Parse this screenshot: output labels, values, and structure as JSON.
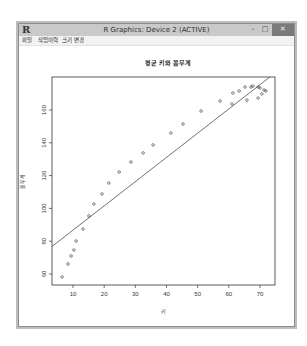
{
  "window": {
    "title": "R Graphics: Device 2 (ACTIVE)",
    "logo": "R",
    "controls": {
      "minimize": "–",
      "maximize": "□",
      "close": "✕"
    }
  },
  "menu": {
    "items": [
      {
        "label": "파일"
      },
      {
        "label": "작업이력"
      },
      {
        "label": "크기 변경"
      }
    ]
  },
  "colors": {
    "titlebar": "#c9c9c9",
    "close_button": "#7a7a7a",
    "plot_ink": "#333333"
  },
  "chart_data": {
    "type": "scatter",
    "title": "평균 키와 몸무게",
    "xlabel": "키",
    "ylabel": "몸무게",
    "xlim": [
      3.5,
      74.5
    ],
    "ylim": [
      54,
      182
    ],
    "xticks": [
      10,
      20,
      30,
      40,
      50,
      60,
      70
    ],
    "yticks": [
      60,
      80,
      100,
      120,
      140,
      160
    ],
    "grid": false,
    "marker": "open-circle",
    "points": [
      [
        6.5,
        58.2
      ],
      [
        8.4,
        66.1
      ],
      [
        9.4,
        71.0
      ],
      [
        10.3,
        74.6
      ],
      [
        11.0,
        80.1
      ],
      [
        13.2,
        87.4
      ],
      [
        15.1,
        95.4
      ],
      [
        16.7,
        102.7
      ],
      [
        19.3,
        108.8
      ],
      [
        21.5,
        115.5
      ],
      [
        24.8,
        122.2
      ],
      [
        28.6,
        128.3
      ],
      [
        32.5,
        133.8
      ],
      [
        35.7,
        138.7
      ],
      [
        41.4,
        146.0
      ],
      [
        45.3,
        151.5
      ],
      [
        51.1,
        159.4
      ],
      [
        57.2,
        165.5
      ],
      [
        61.0,
        163.7
      ],
      [
        61.3,
        170.4
      ],
      [
        63.3,
        171.6
      ],
      [
        65.2,
        174.0
      ],
      [
        65.8,
        166.0
      ],
      [
        67.1,
        174.0
      ],
      [
        67.7,
        174.6
      ],
      [
        69.4,
        174.0
      ],
      [
        69.4,
        167.3
      ],
      [
        70.0,
        173.4
      ],
      [
        70.6,
        169.8
      ],
      [
        71.3,
        172.2
      ],
      [
        71.9,
        171.6
      ]
    ],
    "regression_line": {
      "slope": 1.483,
      "intercept": 71.6
    }
  }
}
